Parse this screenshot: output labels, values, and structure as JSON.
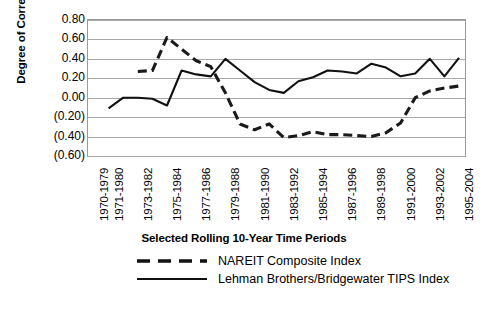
{
  "axis": {
    "y_title": "Degree of Correlation",
    "y_ticks": [
      "0.80",
      "0.60",
      "0.40",
      "0.20",
      "0.00",
      "(0.20)",
      "(0.40)",
      "(0.60)"
    ]
  },
  "caption": "Selected Rolling 10-Year Time Periods",
  "legend": {
    "items": [
      {
        "label": "NAREIT Composite Index",
        "style": "dashed"
      },
      {
        "label": "Lehman Brothers/Bridgewater TIPS Index",
        "style": "solid"
      }
    ]
  },
  "chart_data": {
    "type": "line",
    "title": "",
    "subtitle": "",
    "xlabel": "Selected Rolling 10-Year Time Periods",
    "ylabel": "Degree of Correlation",
    "ylim": [
      -0.6,
      0.8
    ],
    "ytick_values": [
      0.8,
      0.6,
      0.4,
      0.2,
      0.0,
      -0.2,
      -0.4,
      -0.6
    ],
    "ytick_labels": [
      "0.80",
      "0.60",
      "0.40",
      "0.20",
      "0.00",
      "(0.20)",
      "(0.40)",
      "(0.60)"
    ],
    "grid": true,
    "legend_position": "bottom",
    "categories": [
      "1970-1979",
      "1971-1980",
      "1972-1981",
      "1973-1982",
      "1974-1983",
      "1975-1984",
      "1976-1985",
      "1977-1986",
      "1978-1987",
      "1979-1988",
      "1980-1989",
      "1981-1990",
      "1982-1991",
      "1983-1992",
      "1984-1993",
      "1985-1994",
      "1986-1995",
      "1987-1996",
      "1988-1997",
      "1989-1998",
      "1990-1999",
      "1991-2000",
      "1992-2001",
      "1993-2002",
      "1994-2003",
      "1995-2004"
    ],
    "xtick_labels_shown": [
      "1970-1979",
      "1971-1980",
      "1973-1982",
      "1975-1984",
      "1977-1986",
      "1979-1988",
      "1981-1990",
      "1983-1992",
      "1985-1994",
      "1987-1996",
      "1989-1998",
      "1991-2000",
      "1993-2002",
      "1995-2004"
    ],
    "series": [
      {
        "name": "NAREIT Composite Index",
        "style": "dashed",
        "color": "#1a1a1a",
        "values": [
          null,
          null,
          null,
          0.27,
          0.28,
          0.62,
          0.5,
          0.38,
          0.32,
          0.05,
          -0.27,
          -0.33,
          -0.27,
          -0.41,
          -0.39,
          -0.35,
          -0.38,
          -0.38,
          -0.39,
          -0.4,
          -0.36,
          -0.26,
          0.0,
          0.07,
          0.1,
          0.12
        ]
      },
      {
        "name": "Lehman Brothers/Bridgewater TIPS Index",
        "style": "solid",
        "color": "#111111",
        "values": [
          null,
          -0.11,
          0.0,
          0.0,
          -0.01,
          -0.08,
          0.28,
          0.24,
          0.22,
          0.4,
          0.28,
          0.16,
          0.08,
          0.05,
          0.17,
          0.21,
          0.28,
          0.27,
          0.25,
          0.35,
          0.31,
          0.22,
          0.25,
          0.4,
          0.22,
          0.41
        ]
      }
    ]
  }
}
